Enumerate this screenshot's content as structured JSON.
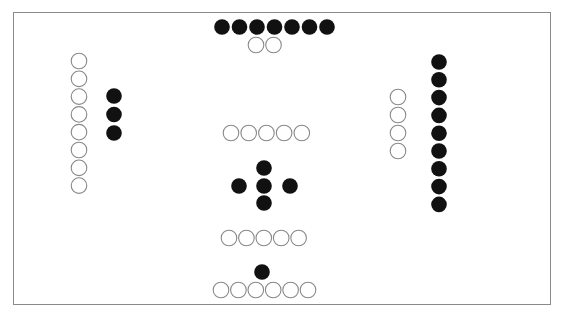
{
  "diagram": {
    "title": "",
    "colors": {
      "filled": "#111111",
      "hollow_stroke": "#888888",
      "frame": "#8a8a8a",
      "background": "#ffffff"
    },
    "groups": [
      {
        "name": "top-filled-row",
        "kind": "filled",
        "count": 7
      },
      {
        "name": "top-hollow-row",
        "kind": "hollow",
        "count": 2
      },
      {
        "name": "left-hollow-column",
        "kind": "hollow",
        "count": 8
      },
      {
        "name": "left-filled-column",
        "kind": "filled",
        "count": 3
      },
      {
        "name": "right-hollow-column",
        "kind": "hollow",
        "count": 4
      },
      {
        "name": "right-filled-column",
        "kind": "filled",
        "count": 9
      },
      {
        "name": "center-upper-hollow-row",
        "kind": "hollow",
        "count": 5
      },
      {
        "name": "center-cross",
        "kind": "filled",
        "count": 5
      },
      {
        "name": "center-lower-hollow-row",
        "kind": "hollow",
        "count": 5
      },
      {
        "name": "bottom-single-filled",
        "kind": "filled",
        "count": 1
      },
      {
        "name": "bottom-hollow-row",
        "kind": "hollow",
        "count": 6
      }
    ]
  }
}
